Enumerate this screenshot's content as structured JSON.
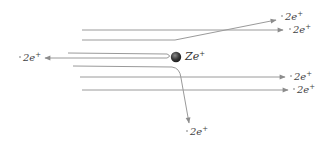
{
  "diagram": {
    "type": "rutherford-scattering",
    "nucleus": {
      "symbol": "Ze",
      "charge_sign": "+",
      "cx": 176,
      "cy": 57,
      "r": 5,
      "color": "#3a3a3a"
    },
    "line_color": "#9a9a9a",
    "particles": [
      {
        "label": "2e",
        "charge_sign": "+",
        "path": "M82 30 L275 20",
        "label_x": 281,
        "label_y": 15
      },
      {
        "label": "2e",
        "charge_sign": "+",
        "path": "M82 40 L175 40 L276 21",
        "label_x": 281,
        "label_y": 15,
        "hidden_label": true
      },
      {
        "label": "2e",
        "charge_sign": "+",
        "path": "M82 30 L283 30",
        "label_x": 288,
        "label_y": 26
      },
      {
        "label": "2e",
        "charge_sign": "+",
        "path": "M68 53 L168 54 Q171 57 166 58 L45 58",
        "label_x": 18,
        "label_y": 53
      },
      {
        "label": "2e",
        "charge_sign": "+",
        "path": "M73 66 L172 67 Q180 68 181 78 L189 123",
        "label_x": 186,
        "label_y": 126
      },
      {
        "label": "2e",
        "charge_sign": "+",
        "path": "M80 77 L285 77",
        "label_x": 290,
        "label_y": 72
      },
      {
        "label": "2e",
        "charge_sign": "+",
        "path": "M82 90 L288 90",
        "label_x": 293,
        "label_y": 85
      }
    ]
  },
  "labels": {
    "nucleus": "Ze",
    "nucleus_charge": "+",
    "alpha": "2e",
    "alpha_charge": "+"
  }
}
